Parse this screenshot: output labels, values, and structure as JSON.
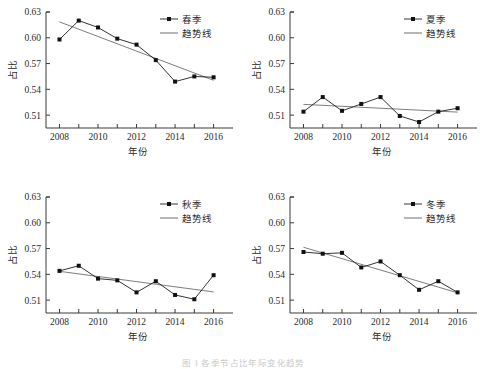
{
  "figure": {
    "caption": "图 1   各季节占比年际变化趋势",
    "panel_count": 4
  },
  "axis": {
    "xlabel": "年份",
    "ylabel": "占比",
    "xticks_major": [
      "2008",
      "2010",
      "2012",
      "2014",
      "2016"
    ],
    "xticks_all": [
      2008,
      2009,
      2010,
      2011,
      2012,
      2013,
      2014,
      2015,
      2016
    ],
    "yticks": [
      "0.51",
      "0.54",
      "0.57",
      "0.60",
      "0.63"
    ],
    "ylim": [
      0.495,
      0.63
    ],
    "xlim": [
      2007.3,
      2016.8
    ]
  },
  "legend": {
    "trend_label": "趋势线"
  },
  "chart_data": [
    {
      "type": "line",
      "title": "",
      "panel": "spring",
      "series_name": "春季",
      "trend_name": "趋势线",
      "xlabel": "年份",
      "ylabel": "占比",
      "ylim": [
        0.495,
        0.63
      ],
      "yticks": [
        0.51,
        0.54,
        0.57,
        0.6,
        0.63
      ],
      "x": [
        2008,
        2009,
        2010,
        2011,
        2012,
        2013,
        2014,
        2015,
        2016
      ],
      "values": [
        0.598,
        0.62,
        0.612,
        0.599,
        0.592,
        0.574,
        0.549,
        0.555,
        0.554
      ],
      "trend": [
        0.6185,
        0.5505
      ],
      "grid": false,
      "legend_position": "top-right"
    },
    {
      "type": "line",
      "title": "",
      "panel": "summer",
      "series_name": "夏季",
      "trend_name": "趋势线",
      "xlabel": "年份",
      "ylabel": "占比",
      "ylim": [
        0.495,
        0.63
      ],
      "yticks": [
        0.51,
        0.54,
        0.57,
        0.6,
        0.63
      ],
      "x": [
        2008,
        2009,
        2010,
        2011,
        2012,
        2013,
        2014,
        2015,
        2016
      ],
      "values": [
        0.514,
        0.531,
        0.515,
        0.523,
        0.531,
        0.509,
        0.502,
        0.514,
        0.518
      ],
      "trend": [
        0.5225,
        0.5135
      ],
      "grid": false,
      "legend_position": "top-right"
    },
    {
      "type": "line",
      "title": "",
      "panel": "autumn",
      "series_name": "秋季",
      "trend_name": "趋势线",
      "xlabel": "年份",
      "ylabel": "占比",
      "ylim": [
        0.495,
        0.63
      ],
      "yticks": [
        0.51,
        0.54,
        0.57,
        0.6,
        0.63
      ],
      "x": [
        2008,
        2009,
        2010,
        2011,
        2012,
        2013,
        2014,
        2015,
        2016
      ],
      "values": [
        0.544,
        0.55,
        0.535,
        0.533,
        0.519,
        0.532,
        0.516,
        0.511,
        0.539
      ],
      "trend": [
        0.5435,
        0.5195
      ],
      "grid": false,
      "legend_position": "top-right"
    },
    {
      "type": "line",
      "title": "",
      "panel": "winter",
      "series_name": "冬季",
      "trend_name": "趋势线",
      "xlabel": "年份",
      "ylabel": "占比",
      "ylim": [
        0.495,
        0.63
      ],
      "yticks": [
        0.51,
        0.54,
        0.57,
        0.6,
        0.63
      ],
      "x": [
        2008,
        2009,
        2010,
        2011,
        2012,
        2013,
        2014,
        2015,
        2016
      ],
      "values": [
        0.566,
        0.564,
        0.565,
        0.548,
        0.555,
        0.539,
        0.522,
        0.532,
        0.519
      ],
      "trend": [
        0.5715,
        0.5185
      ],
      "grid": false,
      "legend_position": "top-right"
    }
  ],
  "colors": {
    "data_line": "#1d1d1d",
    "trend_line": "#6e6e6e",
    "marker": "#111111",
    "axis": "#3a3a3a",
    "text": "#2b2b2b",
    "background": "#ffffff"
  }
}
